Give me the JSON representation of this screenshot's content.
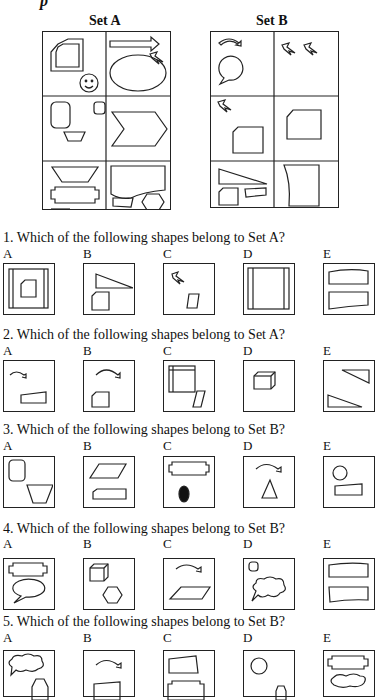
{
  "heading_fragment": "p",
  "set_a": {
    "title": "Set A"
  },
  "set_b": {
    "title": "Set B"
  },
  "questions": [
    {
      "text": "1. Which of the following shapes belong to Set A?",
      "options": [
        "A",
        "B",
        "C",
        "D",
        "E"
      ]
    },
    {
      "text": "2. Which of the following shapes belong to Set A?",
      "options": [
        "A",
        "B",
        "C",
        "D",
        "E"
      ]
    },
    {
      "text": "3. Which of the following shapes belong to Set B?",
      "options": [
        "A",
        "B",
        "C",
        "D",
        "E"
      ]
    },
    {
      "text": "4. Which of the following shapes belong to Set B?",
      "options": [
        "A",
        "B",
        "C",
        "D",
        "E"
      ]
    },
    {
      "text": "5. Which of the following shapes belong to Set B?",
      "options": [
        "A",
        "B",
        "C",
        "D",
        "E"
      ]
    }
  ]
}
